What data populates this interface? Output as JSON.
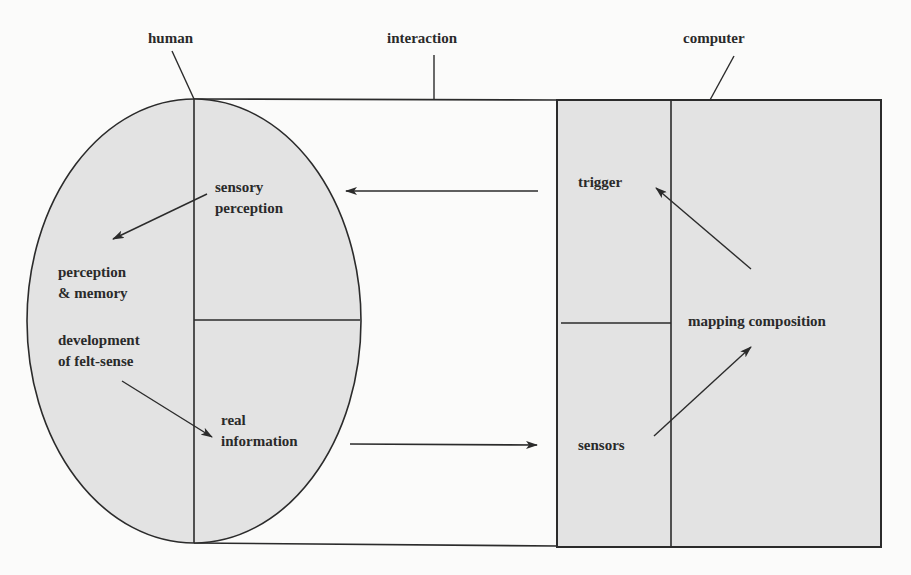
{
  "diagram": {
    "colors": {
      "background": "#fbfbfa",
      "fill": "#e3e3e3",
      "stroke": "#2b2b2b",
      "text": "#2a2a2a"
    },
    "header_labels": {
      "human": "human",
      "interaction": "interaction",
      "computer": "computer"
    },
    "human": {
      "sensory_perception": {
        "line1": "sensory",
        "line2": "perception"
      },
      "perception_memory": {
        "line1": "perception",
        "line2": "& memory"
      },
      "development": {
        "line1": "development",
        "line2": "of felt-sense"
      },
      "real_information": {
        "line1": "real",
        "line2": "information"
      }
    },
    "computer": {
      "trigger": "trigger",
      "mapping_composition": "mapping composition",
      "sensors": "sensors"
    },
    "flows": [
      {
        "from": "trigger",
        "to": "sensory perception"
      },
      {
        "from": "sensory perception",
        "to": "perception & memory"
      },
      {
        "from": "development of felt-sense",
        "to": "real information"
      },
      {
        "from": "real information",
        "to": "sensors"
      },
      {
        "from": "sensors",
        "to": "mapping composition"
      },
      {
        "from": "mapping composition",
        "to": "trigger"
      }
    ]
  }
}
